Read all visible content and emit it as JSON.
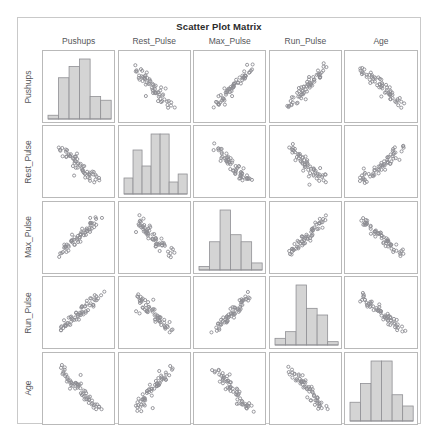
{
  "figure": {
    "title": "Scatter Plot Matrix",
    "variables": [
      "Pushups",
      "Rest_Pulse",
      "Max_Pulse",
      "Run_Pulse",
      "Age"
    ]
  },
  "column_headers": [
    "Pushups",
    "Rest_Pulse",
    "Max_Pulse",
    "Run_Pulse",
    "Age"
  ],
  "row_labels": [
    "Pushups",
    "Rest_Pulse",
    "Max_Pulse",
    "Run_Pulse",
    "Age"
  ],
  "colors": {
    "bar_fill": "#d4d4d4",
    "bar_stroke": "#909094",
    "point_stroke": "#8d8d93",
    "panel_border": "#b9b9b9",
    "frame_border": "#c9c9c9",
    "title_color": "#2b2b2b",
    "label_color": "#55565a",
    "background": "#ffffff"
  },
  "chart_data": {
    "type": "scatter",
    "title": "Scatter Plot Matrix",
    "subtitle": "",
    "xlabel": "",
    "ylabel": "",
    "grid": false,
    "legend": "none",
    "layout": {
      "matrix_rows": 5,
      "matrix_cols": 5,
      "diagonal": "histogram",
      "offdiagonal": "scatter",
      "marker": "open-circle",
      "axis_ticks": false
    },
    "variables": [
      "Pushups",
      "Rest_Pulse",
      "Max_Pulse",
      "Run_Pulse",
      "Age"
    ],
    "axis_ranges": {
      "Pushups": [
        0,
        1
      ],
      "Rest_Pulse": [
        0,
        1
      ],
      "Max_Pulse": [
        0,
        1
      ],
      "Run_Pulse": [
        0,
        1
      ],
      "Age": [
        0,
        1
      ]
    },
    "histograms": [
      {
        "variable": "Pushups",
        "bins": 6,
        "counts": [
          1,
          11,
          14,
          16,
          6,
          5
        ]
      },
      {
        "variable": "Rest_Pulse",
        "bins": 6,
        "counts": [
          4,
          11,
          7,
          15,
          15,
          3,
          5
        ]
      },
      {
        "variable": "Max_Pulse",
        "bins": 6,
        "counts": [
          1,
          8,
          17,
          10,
          8,
          2
        ]
      },
      {
        "variable": "Run_Pulse",
        "bins": 6,
        "counts": [
          2,
          4,
          18,
          11,
          9,
          1
        ]
      },
      {
        "variable": "Age",
        "bins": 6,
        "counts": [
          5,
          10,
          16,
          16,
          7,
          4
        ]
      }
    ],
    "observations": [
      {
        "Pushups": 0.36,
        "Rest_Pulse": 0.34,
        "Max_Pulse": 0.53,
        "Run_Pulse": 0.49,
        "Age": 0.52
      },
      {
        "Pushups": 0.62,
        "Rest_Pulse": 0.2,
        "Max_Pulse": 0.61,
        "Run_Pulse": 0.57,
        "Age": 0.31
      },
      {
        "Pushups": 0.47,
        "Rest_Pulse": 0.62,
        "Max_Pulse": 0.45,
        "Run_Pulse": 0.43,
        "Age": 0.69
      },
      {
        "Pushups": 0.71,
        "Rest_Pulse": 0.41,
        "Max_Pulse": 0.71,
        "Run_Pulse": 0.68,
        "Age": 0.25
      },
      {
        "Pushups": 0.28,
        "Rest_Pulse": 0.55,
        "Max_Pulse": 0.38,
        "Run_Pulse": 0.36,
        "Age": 0.74
      },
      {
        "Pushups": 0.55,
        "Rest_Pulse": 0.29,
        "Max_Pulse": 0.58,
        "Run_Pulse": 0.55,
        "Age": 0.42
      },
      {
        "Pushups": 0.44,
        "Rest_Pulse": 0.49,
        "Max_Pulse": 0.49,
        "Run_Pulse": 0.47,
        "Age": 0.58
      },
      {
        "Pushups": 0.81,
        "Rest_Pulse": 0.26,
        "Max_Pulse": 0.76,
        "Run_Pulse": 0.74,
        "Age": 0.21
      },
      {
        "Pushups": 0.33,
        "Rest_Pulse": 0.68,
        "Max_Pulse": 0.34,
        "Run_Pulse": 0.31,
        "Age": 0.66
      },
      {
        "Pushups": 0.58,
        "Rest_Pulse": 0.37,
        "Max_Pulse": 0.63,
        "Run_Pulse": 0.61,
        "Age": 0.38
      },
      {
        "Pushups": 0.24,
        "Rest_Pulse": 0.72,
        "Max_Pulse": 0.29,
        "Run_Pulse": 0.27,
        "Age": 0.79
      },
      {
        "Pushups": 0.66,
        "Rest_Pulse": 0.31,
        "Max_Pulse": 0.66,
        "Run_Pulse": 0.64,
        "Age": 0.34
      },
      {
        "Pushups": 0.51,
        "Rest_Pulse": 0.45,
        "Max_Pulse": 0.52,
        "Run_Pulse": 0.5,
        "Age": 0.55
      },
      {
        "Pushups": 0.39,
        "Rest_Pulse": 0.58,
        "Max_Pulse": 0.42,
        "Run_Pulse": 0.4,
        "Age": 0.62
      },
      {
        "Pushups": 0.74,
        "Rest_Pulse": 0.23,
        "Max_Pulse": 0.73,
        "Run_Pulse": 0.7,
        "Age": 0.28
      },
      {
        "Pushups": 0.3,
        "Rest_Pulse": 0.64,
        "Max_Pulse": 0.36,
        "Run_Pulse": 0.34,
        "Age": 0.71
      },
      {
        "Pushups": 0.6,
        "Rest_Pulse": 0.39,
        "Max_Pulse": 0.59,
        "Run_Pulse": 0.58,
        "Age": 0.44
      },
      {
        "Pushups": 0.42,
        "Rest_Pulse": 0.52,
        "Max_Pulse": 0.47,
        "Run_Pulse": 0.45,
        "Age": 0.6
      },
      {
        "Pushups": 0.68,
        "Rest_Pulse": 0.28,
        "Max_Pulse": 0.68,
        "Run_Pulse": 0.66,
        "Age": 0.3
      },
      {
        "Pushups": 0.26,
        "Rest_Pulse": 0.7,
        "Max_Pulse": 0.31,
        "Run_Pulse": 0.29,
        "Age": 0.76
      },
      {
        "Pushups": 0.53,
        "Rest_Pulse": 0.43,
        "Max_Pulse": 0.55,
        "Run_Pulse": 0.53,
        "Age": 0.5
      },
      {
        "Pushups": 0.77,
        "Rest_Pulse": 0.25,
        "Max_Pulse": 0.79,
        "Run_Pulse": 0.77,
        "Age": 0.23
      },
      {
        "Pushups": 0.35,
        "Rest_Pulse": 0.6,
        "Max_Pulse": 0.4,
        "Run_Pulse": 0.38,
        "Age": 0.64
      },
      {
        "Pushups": 0.49,
        "Rest_Pulse": 0.47,
        "Max_Pulse": 0.51,
        "Run_Pulse": 0.52,
        "Age": 0.53
      },
      {
        "Pushups": 0.64,
        "Rest_Pulse": 0.33,
        "Max_Pulse": 0.64,
        "Run_Pulse": 0.62,
        "Age": 0.36
      },
      {
        "Pushups": 0.22,
        "Rest_Pulse": 0.75,
        "Max_Pulse": 0.26,
        "Run_Pulse": 0.24,
        "Age": 0.82
      },
      {
        "Pushups": 0.57,
        "Rest_Pulse": 0.36,
        "Max_Pulse": 0.57,
        "Run_Pulse": 0.56,
        "Age": 0.46
      },
      {
        "Pushups": 0.45,
        "Rest_Pulse": 0.5,
        "Max_Pulse": 0.48,
        "Run_Pulse": 0.46,
        "Age": 0.57
      },
      {
        "Pushups": 0.7,
        "Rest_Pulse": 0.3,
        "Max_Pulse": 0.7,
        "Run_Pulse": 0.69,
        "Age": 0.27
      },
      {
        "Pushups": 0.38,
        "Rest_Pulse": 0.56,
        "Max_Pulse": 0.43,
        "Run_Pulse": 0.41,
        "Age": 0.61
      },
      {
        "Pushups": 0.61,
        "Rest_Pulse": 0.38,
        "Max_Pulse": 0.6,
        "Run_Pulse": 0.59,
        "Age": 0.4
      },
      {
        "Pushups": 0.31,
        "Rest_Pulse": 0.66,
        "Max_Pulse": 0.33,
        "Run_Pulse": 0.32,
        "Age": 0.68
      },
      {
        "Pushups": 0.52,
        "Rest_Pulse": 0.44,
        "Max_Pulse": 0.54,
        "Run_Pulse": 0.51,
        "Age": 0.51
      },
      {
        "Pushups": 0.84,
        "Rest_Pulse": 0.21,
        "Max_Pulse": 0.82,
        "Run_Pulse": 0.8,
        "Age": 0.19
      },
      {
        "Pushups": 0.41,
        "Rest_Pulse": 0.53,
        "Max_Pulse": 0.46,
        "Run_Pulse": 0.44,
        "Age": 0.59
      },
      {
        "Pushups": 0.59,
        "Rest_Pulse": 0.4,
        "Max_Pulse": 0.62,
        "Run_Pulse": 0.6,
        "Age": 0.43
      },
      {
        "Pushups": 0.29,
        "Rest_Pulse": 0.63,
        "Max_Pulse": 0.37,
        "Run_Pulse": 0.35,
        "Age": 0.72
      },
      {
        "Pushups": 0.67,
        "Rest_Pulse": 0.32,
        "Max_Pulse": 0.67,
        "Run_Pulse": 0.65,
        "Age": 0.33
      },
      {
        "Pushups": 0.48,
        "Rest_Pulse": 0.48,
        "Max_Pulse": 0.5,
        "Run_Pulse": 0.48,
        "Age": 0.56
      },
      {
        "Pushups": 0.73,
        "Rest_Pulse": 0.27,
        "Max_Pulse": 0.74,
        "Run_Pulse": 0.72,
        "Age": 0.26
      },
      {
        "Pushups": 0.34,
        "Rest_Pulse": 0.59,
        "Max_Pulse": 0.41,
        "Run_Pulse": 0.39,
        "Age": 0.65
      },
      {
        "Pushups": 0.56,
        "Rest_Pulse": 0.42,
        "Max_Pulse": 0.56,
        "Run_Pulse": 0.54,
        "Age": 0.48
      },
      {
        "Pushups": 0.43,
        "Rest_Pulse": 0.51,
        "Max_Pulse": 0.44,
        "Run_Pulse": 0.42,
        "Age": 0.63
      },
      {
        "Pushups": 0.63,
        "Rest_Pulse": 0.35,
        "Max_Pulse": 0.65,
        "Run_Pulse": 0.63,
        "Age": 0.37
      },
      {
        "Pushups": 0.27,
        "Rest_Pulse": 0.69,
        "Max_Pulse": 0.3,
        "Run_Pulse": 0.28,
        "Age": 0.77
      },
      {
        "Pushups": 0.5,
        "Rest_Pulse": 0.46,
        "Max_Pulse": 0.53,
        "Run_Pulse": 0.5,
        "Age": 0.54
      },
      {
        "Pushups": 0.79,
        "Rest_Pulse": 0.24,
        "Max_Pulse": 0.77,
        "Run_Pulse": 0.75,
        "Age": 0.22
      },
      {
        "Pushups": 0.37,
        "Rest_Pulse": 0.57,
        "Max_Pulse": 0.39,
        "Run_Pulse": 0.37,
        "Age": 0.67
      },
      {
        "Pushups": 0.54,
        "Rest_Pulse": 0.41,
        "Max_Pulse": 0.58,
        "Run_Pulse": 0.56,
        "Age": 0.47
      },
      {
        "Pushups": 0.46,
        "Rest_Pulse": 0.54,
        "Max_Pulse": 0.45,
        "Run_Pulse": 0.43,
        "Age": 0.58
      },
      {
        "Pushups": 0.65,
        "Rest_Pulse": 0.34,
        "Max_Pulse": 0.69,
        "Run_Pulse": 0.67,
        "Age": 0.32
      },
      {
        "Pushups": 0.32,
        "Rest_Pulse": 0.61,
        "Max_Pulse": 0.35,
        "Run_Pulse": 0.33,
        "Age": 0.7
      },
      {
        "Pushups": 0.69,
        "Rest_Pulse": 0.29,
        "Max_Pulse": 0.72,
        "Run_Pulse": 0.71,
        "Age": 0.29
      },
      {
        "Pushups": 0.4,
        "Rest_Pulse": 0.55,
        "Max_Pulse": 0.42,
        "Run_Pulse": 0.4,
        "Age": 0.6
      },
      {
        "Pushups": 0.75,
        "Rest_Pulse": 0.22,
        "Max_Pulse": 0.75,
        "Run_Pulse": 0.73,
        "Age": 0.24
      },
      {
        "Pushups": 0.25,
        "Rest_Pulse": 0.73,
        "Max_Pulse": 0.28,
        "Run_Pulse": 0.26,
        "Age": 0.8
      },
      {
        "Pushups": 0.58,
        "Rest_Pulse": 0.39,
        "Max_Pulse": 0.61,
        "Run_Pulse": 0.58,
        "Age": 0.45
      },
      {
        "Pushups": 0.47,
        "Rest_Pulse": 0.49,
        "Max_Pulse": 0.47,
        "Run_Pulse": 0.45,
        "Age": 0.55
      },
      {
        "Pushups": 0.72,
        "Rest_Pulse": 0.26,
        "Max_Pulse": 0.78,
        "Run_Pulse": 0.76,
        "Age": 0.2
      },
      {
        "Pushups": 0.23,
        "Rest_Pulse": 0.77,
        "Max_Pulse": 0.24,
        "Run_Pulse": 0.23,
        "Age": 0.84
      }
    ]
  }
}
